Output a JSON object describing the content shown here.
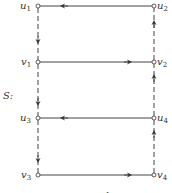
{
  "graph_label": "S:",
  "caption": "FIGURE 12.3",
  "nodes": [
    {
      "id": "u1",
      "base": "u",
      "sub": "1",
      "x": 38,
      "y": 6
    },
    {
      "id": "u2",
      "base": "u",
      "sub": "2",
      "x": 154,
      "y": 6
    },
    {
      "id": "v1",
      "base": "v",
      "sub": "1",
      "x": 38,
      "y": 62
    },
    {
      "id": "v2",
      "base": "v",
      "sub": "2",
      "x": 154,
      "y": 62
    },
    {
      "id": "u3",
      "base": "u",
      "sub": "3",
      "x": 38,
      "y": 118
    },
    {
      "id": "u4",
      "base": "u",
      "sub": "4",
      "x": 154,
      "y": 118
    },
    {
      "id": "v3",
      "base": "v",
      "sub": "3",
      "x": 38,
      "y": 175
    },
    {
      "id": "v4",
      "base": "v",
      "sub": "4",
      "x": 154,
      "y": 175
    }
  ],
  "edges": [
    {
      "from": "u2",
      "to": "u1",
      "style": "solid"
    },
    {
      "from": "v1",
      "to": "v2",
      "style": "solid"
    },
    {
      "from": "u4",
      "to": "u3",
      "style": "solid"
    },
    {
      "from": "v3",
      "to": "v4",
      "style": "solid"
    },
    {
      "from": "u1",
      "to": "v1",
      "style": "dashed"
    },
    {
      "from": "v1",
      "to": "u3",
      "style": "dashed"
    },
    {
      "from": "u3",
      "to": "v3",
      "style": "dashed"
    },
    {
      "from": "v2",
      "to": "u2",
      "style": "dashed"
    },
    {
      "from": "u4",
      "to": "v2",
      "style": "dashed"
    },
    {
      "from": "v4",
      "to": "u4",
      "style": "dashed"
    }
  ],
  "labels": {
    "u1": {
      "base": "u",
      "sub": "1"
    },
    "u2": {
      "base": "u",
      "sub": "2"
    },
    "v1": {
      "base": "v",
      "sub": "1"
    },
    "v2": {
      "base": "v",
      "sub": "2"
    },
    "u3": {
      "base": "u",
      "sub": "3"
    },
    "u4": {
      "base": "u",
      "sub": "4"
    },
    "v3": {
      "base": "v",
      "sub": "3"
    },
    "v4": {
      "base": "v",
      "sub": "4"
    }
  }
}
